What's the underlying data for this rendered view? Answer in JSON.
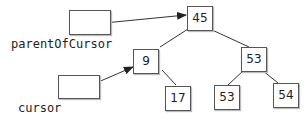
{
  "pointers": [
    {
      "id": "parentOfCursor",
      "label": "parentOfCursor"
    },
    {
      "id": "cursor",
      "label": "cursor"
    }
  ],
  "nodes": [
    {
      "id": "n45",
      "value": "45"
    },
    {
      "id": "n9",
      "value": "9"
    },
    {
      "id": "n53a",
      "value": "53"
    },
    {
      "id": "n17",
      "value": "17"
    },
    {
      "id": "n53b",
      "value": "53"
    },
    {
      "id": "n54",
      "value": "54"
    }
  ],
  "colors": {
    "line": "#333333",
    "border": "#555555"
  }
}
